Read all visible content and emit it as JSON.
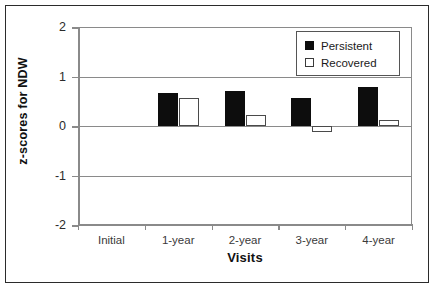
{
  "chart_data": {
    "type": "bar",
    "title": "",
    "xlabel": "Visits",
    "ylabel": "z-scores for NDW",
    "categories": [
      "Initial",
      "1-year",
      "2-year",
      "3-year",
      "4-year"
    ],
    "ylim": [
      -2,
      2
    ],
    "yticks": [
      2,
      1,
      0,
      -1,
      -2
    ],
    "ytick_labels": [
      "2",
      "1",
      "0",
      "-1",
      "-2"
    ],
    "grid": true,
    "legend_position": "top-right",
    "series": [
      {
        "name": "Persistent",
        "color": "#0d0d0d",
        "values": [
          null,
          0.67,
          0.7,
          0.56,
          0.78
        ]
      },
      {
        "name": "Recovered",
        "color": "#ffffff",
        "values": [
          null,
          0.56,
          0.23,
          -0.12,
          0.12
        ]
      }
    ]
  },
  "legend": {
    "items": [
      {
        "label": "Persistent",
        "style": "filled"
      },
      {
        "label": "Recovered",
        "style": "outline"
      }
    ]
  },
  "axes": {
    "y_title": "z-scores for NDW",
    "x_title": "Visits"
  }
}
